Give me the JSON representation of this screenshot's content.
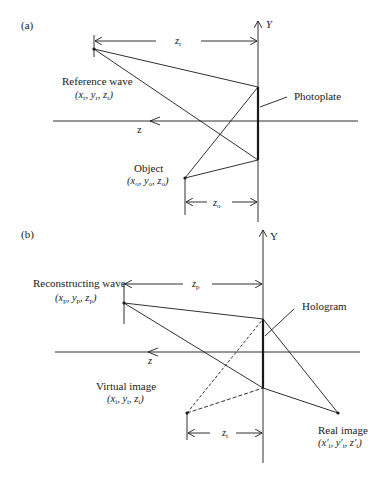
{
  "panel_a": {
    "tag": "(a)",
    "y_axis_label": "Y",
    "z_axis_label": "z",
    "zr_label": "z",
    "zr_sub": "r",
    "zo_label": "z",
    "zo_sub": "o",
    "reference_wave": {
      "label": "Reference wave",
      "coords": [
        "x",
        "r",
        "y",
        "r",
        "z",
        "r"
      ]
    },
    "object": {
      "label": "Object",
      "coords": [
        "x",
        "o",
        "y",
        "o",
        "z",
        "o"
      ]
    },
    "photoplate_label": "Photoplate"
  },
  "panel_b": {
    "tag": "(b)",
    "y_axis_label": "Y",
    "z_axis_label": "z",
    "zp_label": "z",
    "zp_sub": "p",
    "zi_label": "z",
    "zi_sub": "i",
    "reconstructing_wave": {
      "label": "Reconstructing wave",
      "coords": [
        "x",
        "p",
        "y",
        "p",
        "z",
        "p"
      ]
    },
    "virtual_image": {
      "label": "Virtual image",
      "coords": [
        "x",
        "i",
        "y",
        "i",
        "z",
        "i"
      ]
    },
    "real_image": {
      "label": "Real image",
      "coords": [
        "x′",
        "i",
        "y′",
        "i",
        "z′",
        "i"
      ]
    },
    "hologram_label": "Hologram"
  }
}
